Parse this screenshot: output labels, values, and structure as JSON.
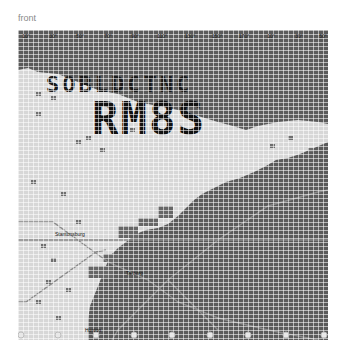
{
  "caption": "front",
  "map": {
    "overlay_text_line1": "SOBLDCTNC",
    "overlay_text_line2": "RM8S",
    "lon_labels": [
      {
        "text": "10°",
        "x": 8
      },
      {
        "text": "30°",
        "x": 35
      },
      {
        "text": "50°",
        "x": 62
      },
      {
        "text": "70°",
        "x": 90
      },
      {
        "text": "90°",
        "x": 117
      },
      {
        "text": "110°",
        "x": 144
      },
      {
        "text": "130°",
        "x": 172
      },
      {
        "text": "150°",
        "x": 199
      },
      {
        "text": "170°",
        "x": 226
      },
      {
        "text": "10°",
        "x": 253
      },
      {
        "text": "30°",
        "x": 281
      },
      {
        "text": "50°",
        "x": 305
      }
    ],
    "place_labels": [
      {
        "text": "Stantonsburg",
        "x": 37,
        "y": 205
      },
      {
        "text": "Tarboro",
        "x": 108,
        "y": 244
      },
      {
        "text": "Hunton",
        "x": 67,
        "y": 301
      }
    ],
    "markers_bottom": [
      {
        "x": 3
      },
      {
        "x": 40
      },
      {
        "x": 78
      },
      {
        "x": 116
      },
      {
        "x": 154
      },
      {
        "x": 192
      },
      {
        "x": 230
      },
      {
        "x": 268
      },
      {
        "x": 306
      }
    ],
    "colors": {
      "land_light": "#d7d7d7",
      "water_dark": "#5a5a5a",
      "text_black": "#111111",
      "route_line": "#8a8a8a",
      "speck": "#6e6e6e"
    }
  }
}
